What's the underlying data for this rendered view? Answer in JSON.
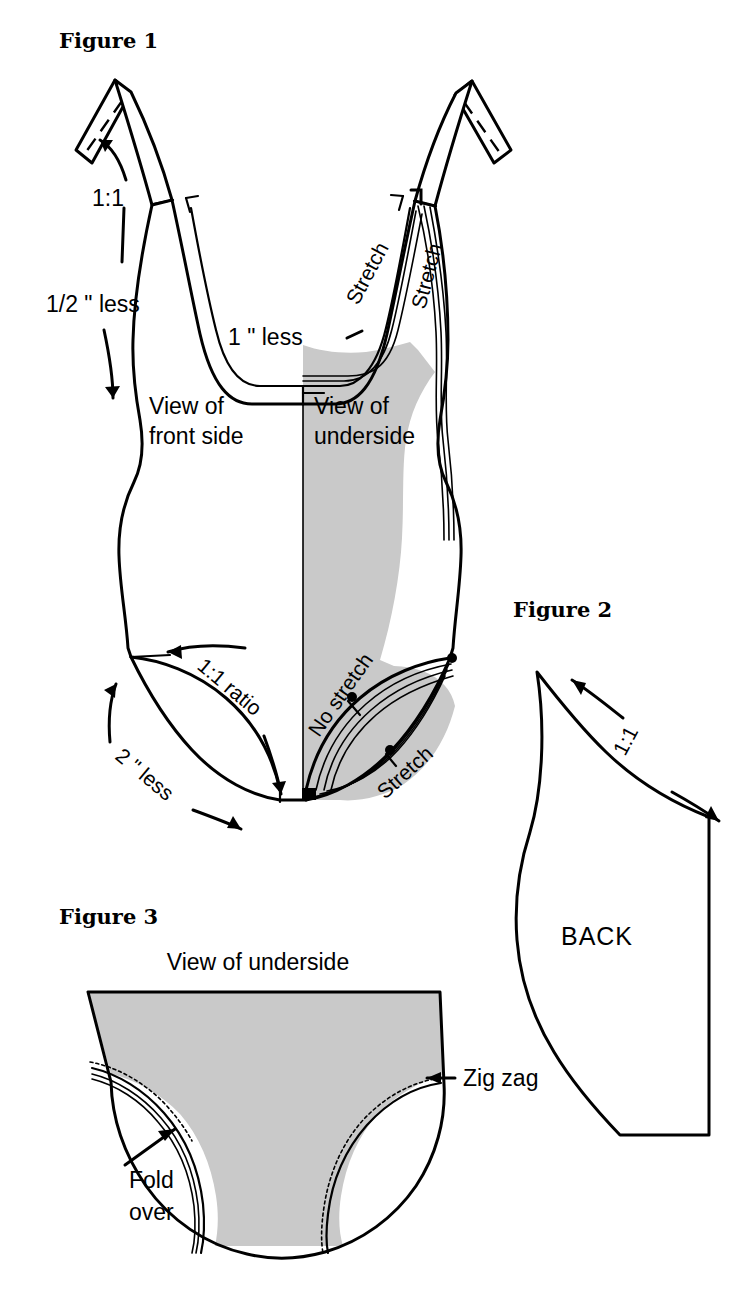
{
  "page": {
    "width": 751,
    "height": 1290,
    "background": "#ffffff",
    "shade_color": "#c9c9c9",
    "ink_color": "#000000"
  },
  "figure1": {
    "title": "Figure 1",
    "labels": {
      "shoulder_ratio": "1:1",
      "armhole_less": "1/2 \" less",
      "neckline_less": "1 \" less",
      "front_view": "View of\nfront side",
      "front_view_line1": "View of",
      "front_view_line2": "front side",
      "underside_view_line1": "View of",
      "underside_view_line2": "underside",
      "stretch_neck": "Stretch",
      "stretch_strap": "Stretch",
      "leg_ratio": "1:1 ratio",
      "leg_less": "2 \" less",
      "no_stretch": "No stretch",
      "stretch_leg": "Stretch"
    }
  },
  "figure2": {
    "title": "Figure 2",
    "labels": {
      "ratio": "1:1",
      "piece_name": "BACK"
    }
  },
  "figure3": {
    "title": "Figure 3",
    "labels": {
      "view": "View of underside",
      "zig_zag": "Zig zag",
      "fold_over_line1": "Fold",
      "fold_over_line2": "over"
    }
  }
}
